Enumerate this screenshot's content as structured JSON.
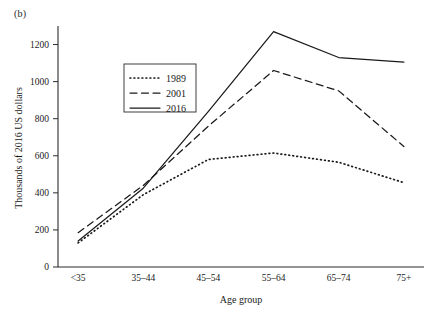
{
  "figure": {
    "panel_label": "(b)",
    "background_color": "#ffffff",
    "line_color": "#1a1a1a"
  },
  "chart_data": {
    "type": "line",
    "title": "",
    "subtitle": "",
    "xlabel": "Age group",
    "ylabel": "Thousands of 2016 US dollars",
    "categories": [
      "<35",
      "35–44",
      "45–54",
      "55–64",
      "65–74",
      "75+"
    ],
    "xtick_labels": [
      "<35",
      "35–44",
      "45–54",
      "55–64",
      "65–74",
      "75+"
    ],
    "ytick_labels": [
      "0",
      "200",
      "400",
      "600",
      "800",
      "1000",
      "1200"
    ],
    "ytick_values": [
      0,
      200,
      400,
      600,
      800,
      1000,
      1200
    ],
    "ylim": [
      0,
      1300
    ],
    "grid": false,
    "legend_position": "upper-left-inside",
    "series": [
      {
        "name": "1989",
        "style": "dotted",
        "values": [
          130,
          390,
          580,
          615,
          565,
          455
        ]
      },
      {
        "name": "2001",
        "style": "dashed",
        "values": [
          185,
          440,
          760,
          1060,
          950,
          650
        ]
      },
      {
        "name": "2016",
        "style": "solid",
        "values": [
          140,
          425,
          840,
          1270,
          1130,
          1105
        ]
      }
    ],
    "legend_entries": [
      {
        "label": "1989",
        "style": "dotted"
      },
      {
        "label": "2001",
        "style": "dashed"
      },
      {
        "label": "2016",
        "style": "solid"
      }
    ]
  }
}
